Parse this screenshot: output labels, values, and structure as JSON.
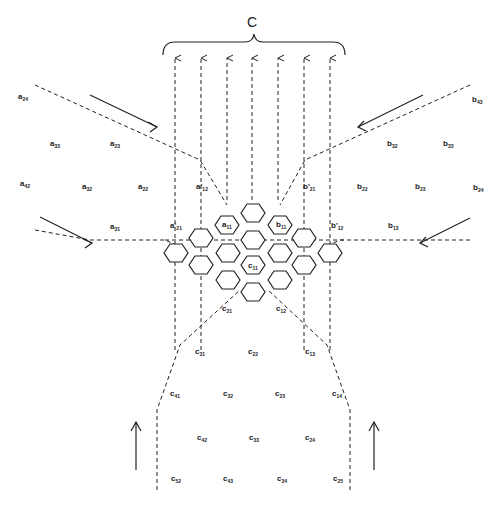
{
  "diagram": {
    "title": "C",
    "colors": {
      "stroke": "#222222",
      "background": "#ffffff"
    },
    "labels": [
      {
        "id": "a24",
        "base": "a",
        "sub": "24",
        "x": 18,
        "y": 93
      },
      {
        "id": "a33",
        "base": "a",
        "sub": "33",
        "x": 50,
        "y": 140
      },
      {
        "id": "a23",
        "base": "a",
        "sub": "23",
        "x": 110,
        "y": 140
      },
      {
        "id": "a42",
        "base": "a",
        "sub": "42",
        "x": 20,
        "y": 180
      },
      {
        "id": "a32",
        "base": "a",
        "sub": "32",
        "x": 82,
        "y": 183
      },
      {
        "id": "a22",
        "base": "a",
        "sub": "22",
        "x": 138,
        "y": 183
      },
      {
        "id": "a31",
        "base": "a",
        "sub": "31",
        "x": 110,
        "y": 223
      },
      {
        "id": "a12p",
        "base": "a'",
        "sub": "12",
        "x": 196,
        "y": 183
      },
      {
        "id": "a21p",
        "base": "a'",
        "sub": "21",
        "x": 170,
        "y": 222
      },
      {
        "id": "a11",
        "base": "a",
        "sub": "11",
        "x": 222,
        "y": 221
      },
      {
        "id": "b11",
        "base": "b",
        "sub": "11",
        "x": 276,
        "y": 221
      },
      {
        "id": "b21p",
        "base": "b'",
        "sub": "21",
        "x": 303,
        "y": 183
      },
      {
        "id": "b12p",
        "base": "b'",
        "sub": "12",
        "x": 331,
        "y": 222
      },
      {
        "id": "b43",
        "base": "b",
        "sub": "43",
        "x": 472,
        "y": 96
      },
      {
        "id": "b32",
        "base": "b",
        "sub": "32",
        "x": 387,
        "y": 140
      },
      {
        "id": "b33",
        "base": "b",
        "sub": "33",
        "x": 443,
        "y": 140
      },
      {
        "id": "b22",
        "base": "b",
        "sub": "22",
        "x": 357,
        "y": 183
      },
      {
        "id": "b23",
        "base": "b",
        "sub": "23",
        "x": 415,
        "y": 183
      },
      {
        "id": "b24",
        "base": "b",
        "sub": "24",
        "x": 473,
        "y": 184
      },
      {
        "id": "b13",
        "base": "b",
        "sub": "13",
        "x": 388,
        "y": 222
      },
      {
        "id": "c11",
        "base": "c",
        "sub": "11",
        "x": 248,
        "y": 262
      },
      {
        "id": "c21",
        "base": "c",
        "sub": "21",
        "x": 222,
        "y": 305
      },
      {
        "id": "c12",
        "base": "c",
        "sub": "12",
        "x": 276,
        "y": 305
      },
      {
        "id": "c31",
        "base": "c",
        "sub": "31",
        "x": 195,
        "y": 348
      },
      {
        "id": "c22",
        "base": "c",
        "sub": "22",
        "x": 248,
        "y": 348
      },
      {
        "id": "c13",
        "base": "c",
        "sub": "13",
        "x": 305,
        "y": 348
      },
      {
        "id": "c41",
        "base": "c",
        "sub": "41",
        "x": 170,
        "y": 390
      },
      {
        "id": "c32",
        "base": "c",
        "sub": "32",
        "x": 223,
        "y": 390
      },
      {
        "id": "c23",
        "base": "c",
        "sub": "23",
        "x": 275,
        "y": 390
      },
      {
        "id": "c14",
        "base": "c",
        "sub": "14",
        "x": 332,
        "y": 390
      },
      {
        "id": "c42",
        "base": "c",
        "sub": "42",
        "x": 197,
        "y": 434
      },
      {
        "id": "c33",
        "base": "c",
        "sub": "33",
        "x": 249,
        "y": 434
      },
      {
        "id": "c24",
        "base": "c",
        "sub": "24",
        "x": 305,
        "y": 434
      },
      {
        "id": "c52",
        "base": "c",
        "sub": "52",
        "x": 171,
        "y": 475
      },
      {
        "id": "c43",
        "base": "c",
        "sub": "43",
        "x": 223,
        "y": 475
      },
      {
        "id": "c34",
        "base": "c",
        "sub": "34",
        "x": 277,
        "y": 475
      },
      {
        "id": "c25",
        "base": "c",
        "sub": "25",
        "x": 333,
        "y": 475
      }
    ],
    "hexagons": [
      [
        253,
        213
      ],
      [
        227,
        225
      ],
      [
        280,
        225
      ],
      [
        201,
        238
      ],
      [
        253,
        240
      ],
      [
        304,
        238
      ],
      [
        176,
        253
      ],
      [
        228,
        253
      ],
      [
        280,
        253
      ],
      [
        330,
        253
      ],
      [
        201,
        265
      ],
      [
        253,
        265
      ],
      [
        304,
        265
      ],
      [
        228,
        280
      ],
      [
        280,
        280
      ],
      [
        253,
        292
      ]
    ],
    "up_arrow_columns": [
      175,
      201,
      227,
      252,
      278,
      304,
      330
    ]
  }
}
